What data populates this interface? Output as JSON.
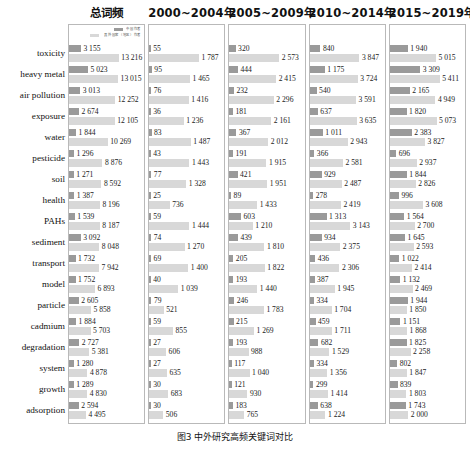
{
  "figure": {
    "caption": "图3  中外研究高频关键词对比",
    "legend": {
      "series1_label": "中国作者",
      "series2_label": "其外国家（地区）作者"
    },
    "colors": {
      "series1": "#9a9a9a",
      "series2": "#d8d8d8",
      "panel_border": "#b9b9b9",
      "text": "#111111"
    }
  },
  "chart_data": {
    "type": "bar",
    "title": "中外研究高频关键词对比",
    "orientation": "horizontal",
    "grouped": true,
    "xlabel": "",
    "ylabel": "",
    "grid": false,
    "legend_position": "top-right",
    "categories": [
      "toxicity",
      "heavy metal",
      "air pollution",
      "exposure",
      "water",
      "pesticide",
      "soil",
      "health",
      "PAHs",
      "sediment",
      "transport",
      "model",
      "particle",
      "cadmium",
      "degradation",
      "system",
      "growth",
      "adsorption"
    ],
    "panels": [
      {
        "title": "总词频",
        "xmax": 13216,
        "series": [
          {
            "name": "中国作者",
            "values": [
              3155,
              5023,
              3013,
              2674,
              1844,
              1296,
              1271,
              1387,
              1539,
              3092,
              1732,
              1752,
              2605,
              1884,
              2727,
              1280,
              1289,
              2594
            ]
          },
          {
            "name": "其外国家（地区）作者",
            "values": [
              13216,
              13015,
              12252,
              12105,
              10269,
              8876,
              8592,
              8196,
              8187,
              8048,
              7942,
              6893,
              5858,
              5703,
              5381,
              4878,
              4830,
              4495
            ]
          }
        ]
      },
      {
        "title": "2000~2004年",
        "xmax": 1787,
        "series": [
          {
            "name": "中国作者",
            "values": [
              55,
              95,
              76,
              36,
              83,
              43,
              77,
              25,
              59,
              74,
              69,
              40,
              79,
              59,
              27,
              27,
              30,
              30
            ]
          },
          {
            "name": "其外国家（地区）作者",
            "values": [
              1787,
              1465,
              1416,
              1236,
              1487,
              1443,
              1328,
              736,
              1444,
              1270,
              1400,
              1039,
              521,
              855,
              606,
              635,
              683,
              506
            ]
          }
        ]
      },
      {
        "title": "2005~2009年",
        "xmax": 2573,
        "series": [
          {
            "name": "中国作者",
            "values": [
              320,
              444,
              232,
              181,
              367,
              191,
              421,
              89,
              603,
              439,
              205,
              193,
              246,
              215,
              193,
              117,
              121,
              183
            ]
          },
          {
            "name": "其外国家（地区）作者",
            "values": [
              2573,
              2415,
              2296,
              2161,
              2012,
              1915,
              1951,
              1433,
              1210,
              1810,
              1822,
              1440,
              1783,
              1269,
              988,
              1040,
              930,
              765
            ]
          }
        ]
      },
      {
        "title": "2010~2014年",
        "xmax": 3847,
        "series": [
          {
            "name": "中国作者",
            "values": [
              840,
              1175,
              540,
              637,
              1011,
              366,
              929,
              278,
              1313,
              934,
              436,
              387,
              334,
              459,
              682,
              334,
              299,
              638
            ]
          },
          {
            "name": "其外国家（地区）作者",
            "values": [
              3847,
              3724,
              3591,
              3635,
              2943,
              2581,
              2487,
              2419,
              3143,
              2375,
              2306,
              1945,
              1704,
              1711,
              1529,
              1356,
              1414,
              1224
            ]
          }
        ]
      },
      {
        "title": "2015~2019年",
        "xmax": 5411,
        "series": [
          {
            "name": "中国作者",
            "values": [
              1940,
              3309,
              2165,
              1820,
              2383,
              696,
              1844,
              996,
              1564,
              1645,
              1022,
              1132,
              1944,
              1151,
              1825,
              802,
              839,
              1743
            ]
          },
          {
            "name": "其外国家（地区）作者",
            "values": [
              5015,
              5411,
              4949,
              5073,
              3827,
              2937,
              2826,
              3608,
              2700,
              2593,
              2414,
              2469,
              1850,
              1868,
              2258,
              1847,
              1803,
              2000
            ]
          }
        ]
      }
    ]
  }
}
